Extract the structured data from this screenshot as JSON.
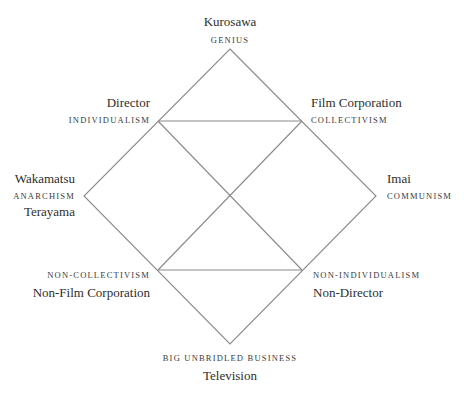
{
  "diagram": {
    "type": "semiotic-square",
    "line_color": "#8a8a8a",
    "text_color": "#2e2e2e",
    "nodes": {
      "top": {
        "name": "Kurosawa",
        "concept": "GENIUS"
      },
      "upper_left": {
        "name": "Director",
        "concept": "INDIVIDUALISM"
      },
      "upper_right": {
        "name": "Film Corporation",
        "concept": "COLLECTIVISM"
      },
      "left": {
        "name_above": "Wakamatsu",
        "concept": "ANARCHISM",
        "name_below": "Terayama"
      },
      "right": {
        "name": "Imai",
        "concept": "COMMUNISM"
      },
      "lower_left": {
        "concept": "NON-COLLECTIVISM",
        "name": "Non-Film Corporation"
      },
      "lower_right": {
        "concept": "NON-INDIVIDUALISM",
        "name": "Non-Director"
      },
      "bottom": {
        "concept": "BIG UNBRIDLED BUSINESS",
        "name": "Television"
      }
    },
    "geometry": {
      "diamond": {
        "top": [
          230,
          49
        ],
        "right": [
          376,
          196
        ],
        "bottom": [
          230,
          344
        ],
        "left": [
          84,
          196
        ]
      },
      "inner_corners": {
        "upper_left": [
          158,
          121
        ],
        "upper_right": [
          302,
          121
        ],
        "lower_left": [
          158,
          270
        ],
        "lower_right": [
          302,
          270
        ]
      }
    }
  }
}
